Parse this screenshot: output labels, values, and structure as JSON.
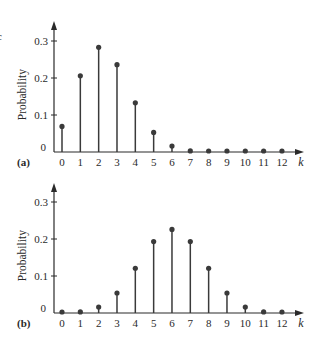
{
  "chart_data": [
    {
      "type": "stem",
      "panel_label": "(a)",
      "title": "",
      "xlabel": "k",
      "ylabel": "Probability",
      "categories": [
        "0",
        "1",
        "2",
        "3",
        "4",
        "5",
        "6",
        "7",
        "8",
        "9",
        "10",
        "11",
        "12"
      ],
      "x": [
        0,
        1,
        2,
        3,
        4,
        5,
        6,
        7,
        8,
        9,
        10,
        11,
        12
      ],
      "values": [
        0.069,
        0.206,
        0.283,
        0.236,
        0.133,
        0.053,
        0.016,
        0.003,
        0.0005,
        0.0001,
        0.0,
        0.0,
        0.0
      ],
      "yticks": [
        0,
        0.1,
        0.2,
        0.3
      ],
      "ytick_labels": [
        "0",
        "0.1",
        "0.2",
        "0.3"
      ],
      "ylim": [
        0,
        0.34
      ],
      "xlim": [
        -0.5,
        13
      ],
      "grid": false,
      "legend": null
    },
    {
      "type": "stem",
      "panel_label": "(b)",
      "title": "",
      "xlabel": "k",
      "ylabel": "Probability",
      "categories": [
        "0",
        "1",
        "2",
        "3",
        "4",
        "5",
        "6",
        "7",
        "8",
        "9",
        "10",
        "11",
        "12"
      ],
      "x": [
        0,
        1,
        2,
        3,
        4,
        5,
        6,
        7,
        8,
        9,
        10,
        11,
        12
      ],
      "values": [
        0.0002,
        0.003,
        0.016,
        0.054,
        0.121,
        0.193,
        0.226,
        0.193,
        0.121,
        0.054,
        0.016,
        0.003,
        0.0002
      ],
      "yticks": [
        0,
        0.1,
        0.2,
        0.3
      ],
      "ytick_labels": [
        "0",
        "0.1",
        "0.2",
        "0.3"
      ],
      "ylim": [
        0,
        0.34
      ],
      "xlim": [
        -0.5,
        13
      ],
      "grid": false,
      "legend": null
    }
  ],
  "figure": {
    "clipped_glyph": "c",
    "colors": {
      "ink": "#2a2a2a",
      "stem": "#3a3a3a",
      "background": "#ffffff"
    }
  }
}
